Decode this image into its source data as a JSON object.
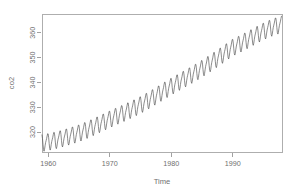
{
  "chart_data": {
    "type": "line",
    "title": "",
    "subtitle": "",
    "xlabel": "Time",
    "ylabel": "co2",
    "xlim": [
      1959.0,
      1998.0
    ],
    "ylim": [
      312.0,
      367.5
    ],
    "xticks": [
      1960,
      1970,
      1980,
      1990
    ],
    "xtick_labels": [
      "1960",
      "1970",
      "1980",
      "1990"
    ],
    "yticks": [
      320,
      330,
      340,
      350,
      360
    ],
    "ytick_labels": [
      "320",
      "330",
      "340",
      "350",
      "360"
    ],
    "grid": false,
    "legend": false,
    "legend_position": "none",
    "frame": "box",
    "series_name": "co2",
    "units": "ppm",
    "n_points": 468,
    "x_start": 1959.0,
    "x_step": 0.08333333,
    "trend_anchors_x": [
      1959.0,
      1965.0,
      1970.0,
      1975.0,
      1980.0,
      1985.0,
      1990.0,
      1997.9
    ],
    "trend_anchors_y": [
      315.8,
      319.7,
      325.3,
      331.1,
      338.5,
      345.7,
      354.2,
      363.4
    ],
    "seasonal_amplitude": 3.1,
    "seasonal_phase": 0.37,
    "seasonal_harmonic2": 0.85,
    "seasonal_harmonic2_phase": 0.1,
    "line_color": "#4d4d4d",
    "axis_color": "#8a8a8a",
    "label_color": "#6f6f6f",
    "background_color": "#ffffff"
  },
  "layout": {
    "plot_left": 42,
    "plot_right": 282,
    "plot_top": 14,
    "plot_bottom": 152,
    "canvas_width": 297,
    "canvas_height": 195
  },
  "labels": {
    "y_axis_title": "co2",
    "x_axis_title": "Time"
  }
}
